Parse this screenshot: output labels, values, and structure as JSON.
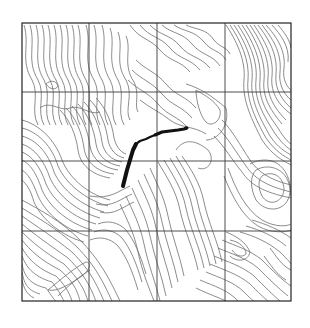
{
  "map": {
    "type": "topographic-contour-map",
    "frame": {
      "x": 22,
      "y": 23,
      "width": 269,
      "height": 278
    },
    "grid": {
      "columns": 4,
      "rows": 4,
      "vertical_lines_x": [
        89,
        157,
        225
      ],
      "horizontal_lines_y": [
        92,
        161,
        231
      ]
    },
    "colors": {
      "background": "#ffffff",
      "contour": "#6e6e6e",
      "grid": "#3a3a3a",
      "frame": "#222222",
      "track": "#111111"
    },
    "track": {
      "description": "GPS track overlay",
      "points": [
        [
          123,
          186
        ],
        [
          127,
          172
        ],
        [
          131,
          158
        ],
        [
          135,
          146
        ],
        [
          140,
          140
        ],
        [
          148,
          138
        ],
        [
          156,
          133
        ],
        [
          164,
          130
        ],
        [
          172,
          130
        ],
        [
          180,
          129
        ],
        [
          186,
          128
        ]
      ]
    }
  }
}
